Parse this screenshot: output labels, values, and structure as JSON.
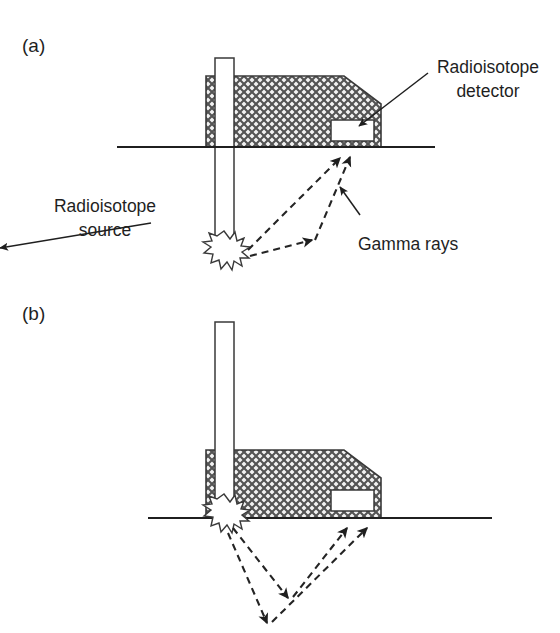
{
  "figure": {
    "background_color": "#ffffff",
    "ink_color": "#1f1f1f",
    "hatch_color": "#4a4a4a"
  },
  "panels": [
    {
      "id": "a",
      "label": "(a)",
      "mode_description": "direct transmission",
      "annotations": [
        {
          "id": "detector",
          "lines": [
            "Radioisotope",
            "detector"
          ],
          "line1": "Radioisotope",
          "line2": "detector",
          "text_anchor": "middle"
        },
        {
          "id": "source",
          "lines": [
            "Radioisotope",
            "source"
          ],
          "line1": "Radioisotope",
          "line2": "source",
          "text_anchor": "middle"
        },
        {
          "id": "gamma",
          "lines": [
            "Gamma rays"
          ],
          "line1": "Gamma rays",
          "text_anchor": "start"
        }
      ]
    },
    {
      "id": "b",
      "label": "(b)",
      "mode_description": "backscatter",
      "annotations": []
    }
  ],
  "components": {
    "gauge_body_name": "Gauge housing (cross-hatched)",
    "probe_rod_name": "Source rod / probe",
    "detector_box_name": "Detector window",
    "ground_line_name": "Ground surface",
    "burst_name": "Radioisotope source burst",
    "gamma_ray_name": "Gamma ray path"
  }
}
